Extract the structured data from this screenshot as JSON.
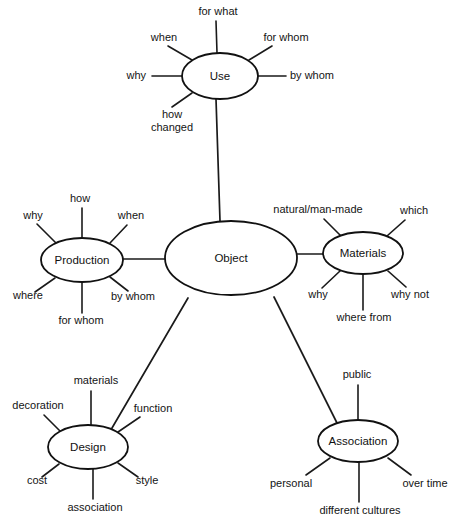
{
  "diagram": {
    "style": {
      "background": "#ffffff",
      "line_color": "#1a1a1a",
      "node_fill": "#ffffff",
      "node_stroke": "#111111",
      "text_color": "#141414"
    },
    "center": {
      "id": "object",
      "label": "Object",
      "cx": 231,
      "cy": 258,
      "rx": 66,
      "ry": 37
    },
    "branches": [
      {
        "id": "use",
        "label": "Use",
        "cx": 220,
        "cy": 76,
        "rx": 38,
        "ry": 23,
        "trunk": {
          "x1": 216,
          "y1": 99,
          "x2": 220,
          "y2": 221
        },
        "leaves": [
          {
            "label": "for what",
            "lx": 218,
            "ly": 15,
            "anchor": "middle",
            "x1": 217,
            "y1": 53,
            "x2": 216,
            "y2": 21
          },
          {
            "label": "when",
            "lx": 164,
            "ly": 41,
            "anchor": "middle",
            "x1": 192,
            "y1": 60,
            "x2": 168,
            "y2": 46
          },
          {
            "label": "for whom",
            "lx": 286,
            "ly": 41,
            "anchor": "middle",
            "x1": 249,
            "y1": 60,
            "x2": 272,
            "y2": 46
          },
          {
            "label": "why",
            "lx": 146,
            "ly": 79,
            "anchor": "end",
            "x1": 182,
            "y1": 76,
            "x2": 152,
            "y2": 76
          },
          {
            "label": "by whom",
            "lx": 290,
            "ly": 79,
            "anchor": "start",
            "x1": 258,
            "y1": 76,
            "x2": 286,
            "y2": 76
          },
          {
            "label": "how",
            "lx": 172,
            "ly": 118,
            "anchor": "middle",
            "x1": 192,
            "y1": 93,
            "x2": 172,
            "y2": 107
          },
          {
            "label": "changed",
            "lx": 172,
            "ly": 131,
            "anchor": "middle",
            "x1": null,
            "y1": null,
            "x2": null,
            "y2": null
          }
        ]
      },
      {
        "id": "production",
        "label": "Production",
        "cx": 82,
        "cy": 260,
        "rx": 41,
        "ry": 22,
        "trunk": {
          "x1": 123,
          "y1": 259,
          "x2": 166,
          "y2": 259
        },
        "leaves": [
          {
            "label": "how",
            "lx": 80,
            "ly": 202,
            "anchor": "middle",
            "x1": 82,
            "y1": 238,
            "x2": 82,
            "y2": 208
          },
          {
            "label": "why",
            "lx": 33,
            "ly": 219,
            "anchor": "middle",
            "x1": 56,
            "y1": 243,
            "x2": 37,
            "y2": 224
          },
          {
            "label": "when",
            "lx": 131,
            "ly": 219,
            "anchor": "middle",
            "x1": 110,
            "y1": 243,
            "x2": 127,
            "y2": 225
          },
          {
            "label": "where",
            "lx": 28,
            "ly": 299,
            "anchor": "middle",
            "x1": 55,
            "y1": 278,
            "x2": 35,
            "y2": 292
          },
          {
            "label": "by whom",
            "lx": 133,
            "ly": 300,
            "anchor": "middle",
            "x1": 110,
            "y1": 277,
            "x2": 128,
            "y2": 291
          },
          {
            "label": "for whom",
            "lx": 81,
            "ly": 324,
            "anchor": "middle",
            "x1": 82,
            "y1": 282,
            "x2": 82,
            "y2": 313
          }
        ]
      },
      {
        "id": "materials",
        "label": "Materials",
        "cx": 363,
        "cy": 253,
        "rx": 40,
        "ry": 21,
        "trunk": {
          "x1": 323,
          "y1": 254,
          "x2": 296,
          "y2": 254
        },
        "leaves": [
          {
            "label": "natural/man-made",
            "lx": 318,
            "ly": 213,
            "anchor": "middle",
            "x1": 341,
            "y1": 236,
            "x2": 324,
            "y2": 219
          },
          {
            "label": "which",
            "lx": 414,
            "ly": 214,
            "anchor": "middle",
            "x1": 387,
            "y1": 236,
            "x2": 405,
            "y2": 220
          },
          {
            "label": "why",
            "lx": 318,
            "ly": 298,
            "anchor": "middle",
            "x1": 340,
            "y1": 271,
            "x2": 322,
            "y2": 288
          },
          {
            "label": "why not",
            "lx": 410,
            "ly": 298,
            "anchor": "middle",
            "x1": 388,
            "y1": 271,
            "x2": 406,
            "y2": 287
          },
          {
            "label": "where from",
            "lx": 364,
            "ly": 321,
            "anchor": "middle",
            "x1": 363,
            "y1": 274,
            "x2": 363,
            "y2": 310
          }
        ]
      },
      {
        "id": "design",
        "label": "Design",
        "cx": 88,
        "cy": 447,
        "rx": 40,
        "ry": 22,
        "trunk": {
          "x1": 112,
          "y1": 428,
          "x2": 188,
          "y2": 298
        },
        "leaves": [
          {
            "label": "materials",
            "lx": 96,
            "ly": 384,
            "anchor": "middle",
            "x1": 91,
            "y1": 425,
            "x2": 91,
            "y2": 391
          },
          {
            "label": "decoration",
            "lx": 38,
            "ly": 409,
            "anchor": "middle",
            "x1": 60,
            "y1": 431,
            "x2": 44,
            "y2": 415
          },
          {
            "label": "function",
            "lx": 153,
            "ly": 412,
            "anchor": "middle",
            "x1": 118,
            "y1": 432,
            "x2": 140,
            "y2": 417
          },
          {
            "label": "cost",
            "lx": 37,
            "ly": 484,
            "anchor": "middle",
            "x1": 59,
            "y1": 464,
            "x2": 42,
            "y2": 477
          },
          {
            "label": "style",
            "lx": 147,
            "ly": 484,
            "anchor": "middle",
            "x1": 118,
            "y1": 463,
            "x2": 138,
            "y2": 477
          },
          {
            "label": "association",
            "lx": 95,
            "ly": 511,
            "anchor": "middle",
            "x1": 93,
            "y1": 469,
            "x2": 93,
            "y2": 499
          }
        ]
      },
      {
        "id": "association",
        "label": "Association",
        "cx": 358,
        "cy": 441,
        "rx": 40,
        "ry": 21,
        "trunk": {
          "x1": 337,
          "y1": 423,
          "x2": 274,
          "y2": 297
        },
        "leaves": [
          {
            "label": "public",
            "lx": 357,
            "ly": 378,
            "anchor": "middle",
            "x1": 358,
            "y1": 420,
            "x2": 358,
            "y2": 385
          },
          {
            "label": "personal",
            "lx": 291,
            "ly": 487,
            "anchor": "middle",
            "x1": 330,
            "y1": 458,
            "x2": 306,
            "y2": 475
          },
          {
            "label": "over time",
            "lx": 425,
            "ly": 487,
            "anchor": "middle",
            "x1": 388,
            "y1": 458,
            "x2": 411,
            "y2": 475
          },
          {
            "label": "different cultures",
            "lx": 360,
            "ly": 514,
            "anchor": "middle",
            "x1": 359,
            "y1": 462,
            "x2": 359,
            "y2": 502
          }
        ]
      }
    ]
  }
}
